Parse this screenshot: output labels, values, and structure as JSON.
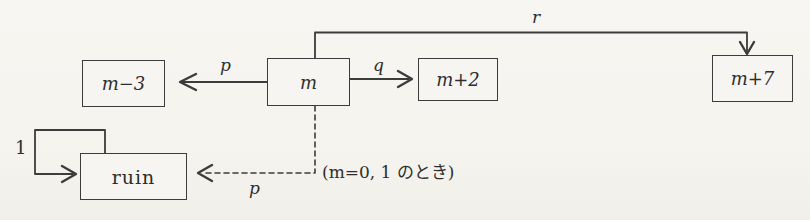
{
  "diagram": {
    "background_color": "#f6f5f1",
    "line_color": "#3c3c3c",
    "nodes": [
      {
        "id": "m-minus-3",
        "label": "m−3"
      },
      {
        "id": "m",
        "label": "m"
      },
      {
        "id": "m-plus-2",
        "label": "m+2"
      },
      {
        "id": "m-plus-7",
        "label": "m+7"
      },
      {
        "id": "ruin",
        "label": "ruin"
      }
    ],
    "edges": [
      {
        "from": "m",
        "to": "m-minus-3",
        "label": "p",
        "style": "solid"
      },
      {
        "from": "m",
        "to": "m-plus-2",
        "label": "q",
        "style": "solid"
      },
      {
        "from": "m",
        "to": "m-plus-7",
        "label": "r",
        "style": "solid"
      },
      {
        "from": "ruin",
        "to": "ruin",
        "label": "1",
        "style": "solid"
      },
      {
        "from": "m",
        "to": "ruin",
        "label": "p",
        "style": "dashed"
      }
    ],
    "annotation": "(m=0, 1 のとき)"
  }
}
